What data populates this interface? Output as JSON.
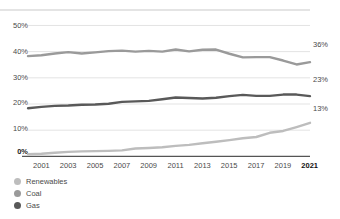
{
  "chart_data": {
    "type": "line",
    "title": "",
    "subtitle": "",
    "xlabel": "",
    "ylabel": "",
    "xlim": [
      2000,
      2021
    ],
    "ylim": [
      0,
      55
    ],
    "grid": true,
    "legend_position": "bottom-left",
    "y_ticks": [
      "0%",
      "10%",
      "20%",
      "30%",
      "40%",
      "50%"
    ],
    "y_tick_values": [
      0,
      10,
      20,
      30,
      40,
      50
    ],
    "x_ticks": [
      "2001",
      "2003",
      "2005",
      "2007",
      "2009",
      "2011",
      "2013",
      "2015",
      "2017",
      "2019",
      "2021"
    ],
    "x_tick_values": [
      2001,
      2003,
      2005,
      2007,
      2009,
      2011,
      2013,
      2015,
      2017,
      2019,
      2021
    ],
    "x": [
      2000,
      2001,
      2002,
      2003,
      2004,
      2005,
      2006,
      2007,
      2008,
      2009,
      2010,
      2011,
      2012,
      2013,
      2014,
      2015,
      2016,
      2017,
      2018,
      2019,
      2020,
      2021
    ],
    "series": [
      {
        "name": "Coal",
        "color": "#9a9a9a",
        "end_label": "36%",
        "end_value": 36,
        "values": [
          38.3,
          38.6,
          39.3,
          39.8,
          39.3,
          39.7,
          40.2,
          40.4,
          40.0,
          40.3,
          40.0,
          40.8,
          40.1,
          40.7,
          40.8,
          39.2,
          37.8,
          37.9,
          37.9,
          36.6,
          35.1,
          36.0
        ]
      },
      {
        "name": "Gas",
        "color": "#595959",
        "end_label": "23%",
        "end_value": 23,
        "values": [
          18.4,
          18.9,
          19.3,
          19.4,
          19.7,
          19.8,
          20.1,
          20.8,
          21.0,
          21.2,
          21.8,
          22.5,
          22.3,
          22.1,
          22.4,
          23.0,
          23.5,
          23.1,
          23.1,
          23.6,
          23.6,
          23.0
        ]
      },
      {
        "name": "Renewables",
        "color": "#bdbdbd",
        "end_label": "13%",
        "end_value": 13,
        "values": [
          0.8,
          1.0,
          1.4,
          1.7,
          1.9,
          2.0,
          2.1,
          2.3,
          3.0,
          3.2,
          3.5,
          4.0,
          4.4,
          5.0,
          5.6,
          6.2,
          6.9,
          7.4,
          9.0,
          9.7,
          11.2,
          12.8
        ]
      }
    ],
    "legend": [
      {
        "label": "Renewables",
        "color": "#bdbdbd"
      },
      {
        "label": "Coal",
        "color": "#9a9a9a"
      },
      {
        "label": "Gas",
        "color": "#595959"
      }
    ]
  },
  "colors": {
    "grid": "#e3e3e3",
    "top_rule": "#c9c9c9",
    "baseline": "#555555",
    "text": "#4a4a4a",
    "text_emphasis": "#111111"
  }
}
